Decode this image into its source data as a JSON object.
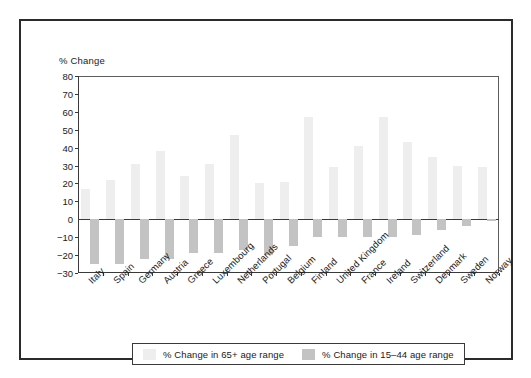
{
  "figure": {
    "y_axis_caption": "% Change"
  },
  "legend": {
    "entries": [
      {
        "label": "% Change in 65+ age range",
        "swatch": "light-gray"
      },
      {
        "label": "% Change in 15–44 age range",
        "swatch": "medium-gray"
      }
    ]
  },
  "colors": {
    "bar_65plus": "#eeeeee",
    "bar_15_44": "#c3c3c3",
    "axis": "#3a3a3a",
    "frame": "#2b2b2b",
    "text": "#1a1a1a",
    "background": "#ffffff"
  },
  "chart_data": {
    "type": "bar",
    "title": "",
    "subtitle": "",
    "xlabel": "",
    "ylabel": "% Change",
    "ylim": [
      -30,
      80
    ],
    "yticks": [
      80,
      70,
      60,
      50,
      40,
      30,
      20,
      10,
      0,
      -10,
      -20,
      -30
    ],
    "ytick_labels": [
      "80",
      "70",
      "60",
      "50",
      "40",
      "30",
      "20",
      "10",
      "0",
      "−10",
      "−20",
      "−30"
    ],
    "grid": false,
    "legend_position": "bottom",
    "categories": [
      "Italy",
      "Spain",
      "Germany",
      "Austria",
      "Greece",
      "Luxembourg",
      "Netherlands",
      "Portugal",
      "Belgium",
      "Finland",
      "United Kingdom",
      "France",
      "Ireland",
      "Switzerland",
      "Denmark",
      "Sweden",
      "Norway"
    ],
    "series": [
      {
        "name": "% Change in 65+ age range",
        "color": "#eeeeee",
        "values": [
          17,
          22,
          31,
          38,
          24,
          31,
          47,
          20,
          21,
          57,
          29,
          41,
          57,
          43,
          35,
          30,
          29
        ]
      },
      {
        "name": "% Change in 15–44 age range",
        "color": "#c3c3c3",
        "values": [
          -25,
          -25,
          -22,
          -22,
          -19,
          -19,
          -17,
          -20,
          -15,
          -10,
          -10,
          -10,
          -10,
          -9,
          -6,
          -4,
          -1
        ]
      }
    ]
  }
}
